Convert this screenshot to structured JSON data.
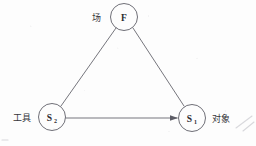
{
  "diagram": {
    "background_color": "#fdfdfd",
    "line_color": "#5d5d66",
    "text_color": "#2b2b2f",
    "nodes": [
      {
        "id": "field",
        "symbol": "F",
        "subscript": "",
        "side_label": "场",
        "side_label_position": "left",
        "cx": 124,
        "cy": 17,
        "r": 13.5,
        "label_x": 96,
        "label_y": 20
      },
      {
        "id": "tool",
        "symbol": "S",
        "subscript": "2",
        "side_label": "工具",
        "side_label_position": "left",
        "cx": 52,
        "cy": 117,
        "r": 13.5,
        "label_x": 12,
        "label_y": 121
      },
      {
        "id": "object",
        "symbol": "S",
        "subscript": "1",
        "side_label": "对象",
        "side_label_position": "right",
        "cx": 192,
        "cy": 118,
        "r": 13.5,
        "label_x": 211,
        "label_y": 122
      }
    ],
    "edges": [
      {
        "id": "field-to-tool",
        "from": "field",
        "to": "tool",
        "style": "line",
        "arrow": false,
        "x1": 116,
        "y1": 28,
        "x2": 61,
        "y2": 106
      },
      {
        "id": "field-to-object",
        "from": "field",
        "to": "object",
        "style": "line",
        "arrow": false,
        "x1": 133,
        "y1": 28,
        "x2": 184,
        "y2": 106
      },
      {
        "id": "tool-to-object",
        "from": "tool",
        "to": "object",
        "style": "line",
        "arrow": true,
        "x1": 66,
        "y1": 118,
        "x2": 178,
        "y2": 118
      }
    ],
    "artifacts": [
      {
        "id": "scan-streak",
        "x1": 236,
        "y1": 128,
        "x2": 252,
        "y2": 116
      },
      {
        "id": "scan-streak-2",
        "x1": 242,
        "y1": 130,
        "x2": 254,
        "y2": 121
      }
    ]
  }
}
